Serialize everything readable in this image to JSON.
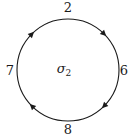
{
  "diagram": {
    "type": "cycle",
    "center_label": {
      "base": "σ",
      "subscript": "2"
    },
    "direction": "clockwise",
    "nodes": [
      {
        "position": "top",
        "label": "2"
      },
      {
        "position": "right",
        "label": "6"
      },
      {
        "position": "bottom",
        "label": "8"
      },
      {
        "position": "left",
        "label": "7"
      }
    ],
    "arrows": [
      {
        "from": "2",
        "to": "6"
      },
      {
        "from": "6",
        "to": "8"
      },
      {
        "from": "8",
        "to": "7"
      },
      {
        "from": "7",
        "to": "2"
      }
    ],
    "colors": {
      "stroke": "#1a1a1a",
      "background": "#ffffff"
    }
  }
}
